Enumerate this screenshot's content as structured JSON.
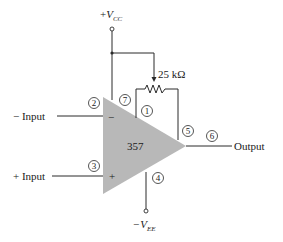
{
  "diagram": {
    "type": "op-amp offset null circuit",
    "amplifier": {
      "label": "357",
      "fill_color": "#b8b8b8"
    },
    "supply_positive": {
      "sign": "+",
      "symbol": "V",
      "subscript": "CC"
    },
    "supply_negative": {
      "sign": "−",
      "symbol": "V",
      "subscript": "EE"
    },
    "potentiometer": {
      "value": "25 kΩ"
    },
    "inputs": {
      "inverting": {
        "label": "− Input",
        "sign": "−",
        "pin": "2"
      },
      "noninverting": {
        "label": "+ Input",
        "sign": "+",
        "pin": "3"
      }
    },
    "output": {
      "label": "Output",
      "pin": "6"
    },
    "pins": {
      "p1": "1",
      "p2": "2",
      "p3": "3",
      "p4": "4",
      "p5": "5",
      "p6": "6",
      "p7": "7"
    }
  }
}
